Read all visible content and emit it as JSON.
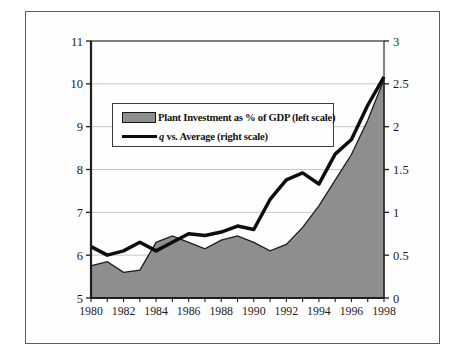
{
  "chart_data": {
    "type": "area+line combo (dual axis)",
    "title": "",
    "xlabel": "",
    "x": [
      1980,
      1981,
      1982,
      1983,
      1984,
      1985,
      1986,
      1987,
      1988,
      1989,
      1990,
      1991,
      1992,
      1993,
      1994,
      1995,
      1996,
      1997,
      1998
    ],
    "x_tick_values": [
      1980,
      1982,
      1984,
      1986,
      1988,
      1990,
      1992,
      1994,
      1996,
      1998
    ],
    "x_tick_labels": [
      "1980",
      "1982",
      "1984",
      "1986",
      "1988",
      "1990",
      "1992",
      "1994",
      "1996",
      "1998"
    ],
    "series": [
      {
        "name": "Plant Investment as % of GDP (left scale)",
        "type": "area",
        "axis": "left",
        "values": [
          5.75,
          5.85,
          5.6,
          5.65,
          6.3,
          6.45,
          6.3,
          6.15,
          6.35,
          6.45,
          6.3,
          6.1,
          6.25,
          6.65,
          7.15,
          7.75,
          8.35,
          9.15,
          10.1
        ],
        "fill": "#8e8e8e",
        "outline": "#1c1c1c"
      },
      {
        "name": "q vs. Average (right scale)",
        "type": "line",
        "axis": "right",
        "values": [
          0.6,
          0.5,
          0.55,
          0.65,
          0.55,
          0.65,
          0.75,
          0.73,
          0.77,
          0.84,
          0.8,
          1.15,
          1.38,
          1.46,
          1.33,
          1.68,
          1.85,
          2.25,
          2.58
        ],
        "color": "#0e0e0e",
        "width": 3.5
      }
    ],
    "left_axis": {
      "min": 5,
      "max": 11,
      "tick_values": [
        5,
        6,
        7,
        8,
        9,
        10,
        11
      ],
      "tick_labels": [
        "5",
        "6",
        "7",
        "8",
        "9",
        "10",
        "11"
      ]
    },
    "right_axis": {
      "min": 0,
      "max": 3,
      "tick_values": [
        0,
        0.5,
        1,
        1.5,
        2,
        2.5,
        3
      ],
      "tick_labels": [
        "0",
        "0.5",
        "1",
        "1.5",
        "2",
        "2.5",
        "3"
      ]
    },
    "grid": {
      "horizontal": true,
      "color": "#c6c6c6"
    },
    "legend": {
      "position": "upper-left-inside",
      "area_label": "Plant Investment as % of GDP (left scale)",
      "q_label_italic": "q",
      "q_label_rest": " vs. Average (right scale)"
    }
  }
}
